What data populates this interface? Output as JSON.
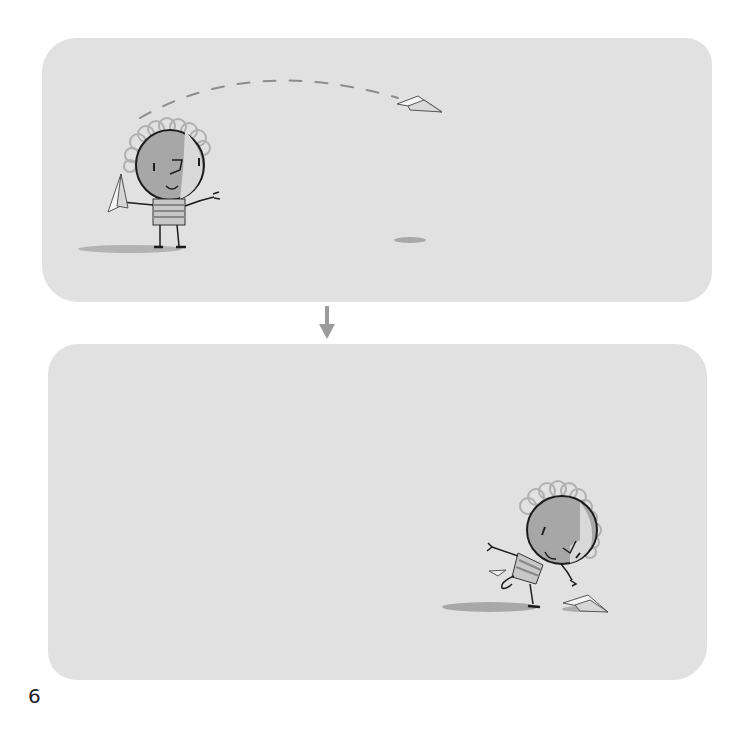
{
  "page": {
    "number": "6",
    "colors": {
      "background": "#ffffff",
      "panel": "#e1e1e1",
      "head_gray": "#a7a7a7",
      "hair": "#b3b3b3",
      "ink": "#1c1c1c",
      "arrow": "#9b9b9b",
      "shadow": "#9a9a9a"
    }
  },
  "panels": [
    {
      "id": "top",
      "description": "Child holding a paper airplane; dashed flight path arcs to a paper airplane in the air with its shadow on the ground"
    },
    {
      "id": "bottom",
      "description": "Child running and reaching toward the paper airplane landed on the ground"
    }
  ],
  "icons": {
    "transition": "arrow-down-icon"
  }
}
